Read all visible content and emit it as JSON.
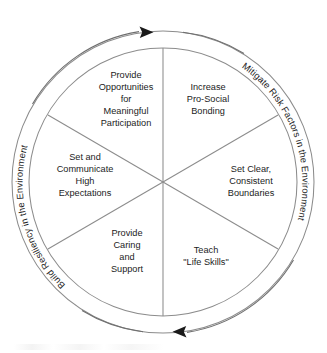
{
  "diagram": {
    "type": "circular-sector-diagram",
    "geometry": {
      "center_x": 163,
      "center_y": 182,
      "outer_radius": 151,
      "inner_radius": 134,
      "sector_count": 6
    },
    "colors": {
      "stroke": "#8c8c8c",
      "text": "#1c1c1c",
      "arrow": "#1a1a1a",
      "background": "#ffffff"
    },
    "sectors": [
      {
        "id": "increase-pro-social-bonding",
        "position": "top-right",
        "lines": [
          "Increase",
          "Pro-Social",
          "Bonding"
        ]
      },
      {
        "id": "set-clear-consistent-boundaries",
        "position": "right",
        "lines": [
          "Set Clear,",
          "Consistent",
          "Boundaries"
        ]
      },
      {
        "id": "teach-life-skills",
        "position": "bottom-right",
        "lines": [
          "Teach",
          "\"Life Skills\""
        ]
      },
      {
        "id": "provide-caring-and-support",
        "position": "bottom-left",
        "lines": [
          "Provide",
          "Caring",
          "and",
          "Support"
        ]
      },
      {
        "id": "set-and-communicate-high-expectations",
        "position": "left",
        "lines": [
          "Set and",
          "Communicate",
          "High",
          "Expectations"
        ]
      },
      {
        "id": "provide-opportunities-for-meaningful-participation",
        "position": "top-left",
        "lines": [
          "Provide",
          "Opportunities",
          "for",
          "Meaningful",
          "Participation"
        ]
      }
    ],
    "ring_labels": [
      {
        "id": "mitigate-risk-factors",
        "side": "right",
        "text": "Mitigate Risk Factors in the Environment"
      },
      {
        "id": "build-resiliency",
        "side": "left",
        "text": "Build Resiliency in the Environment"
      }
    ],
    "arrows": [
      {
        "id": "top-arrow",
        "position": "top",
        "direction": "clockwise-right"
      },
      {
        "id": "bottom-arrow",
        "position": "bottom",
        "direction": "clockwise-left"
      }
    ]
  }
}
